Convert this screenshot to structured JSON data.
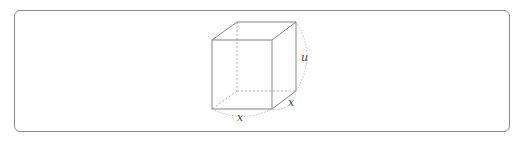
{
  "figure": {
    "type": "cube-diagram",
    "labels": {
      "front_bottom_edge": "x",
      "side_bottom_edge": "x",
      "height_edge": "u"
    },
    "colors": {
      "border": "#8a8a8a",
      "edges": "#777777",
      "hidden_edges": "#999999",
      "label": "#444444"
    }
  }
}
